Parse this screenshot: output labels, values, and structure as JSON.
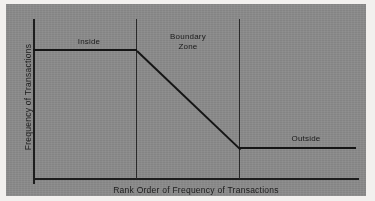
{
  "chart_data": {
    "type": "line",
    "title": "",
    "xlabel": "Rank Order of Frequency of Transactions",
    "ylabel": "Frequency of Transactions",
    "grid": false,
    "legend": "none",
    "axis_ticks": {
      "x": [],
      "y": []
    },
    "annotations": [
      {
        "name": "inside",
        "text": "Inside"
      },
      {
        "name": "boundary-zone",
        "text": "Boundary\nZone"
      },
      {
        "name": "outside",
        "text": "Outside"
      }
    ],
    "zone_dividers": [
      {
        "name": "inside-boundary-divider",
        "x": 0.32
      },
      {
        "name": "boundary-outside-divider",
        "x": 0.63
      }
    ],
    "series": [
      {
        "name": "transaction-frequency",
        "points": [
          {
            "x": 0.0,
            "y": 0.79
          },
          {
            "x": 0.32,
            "y": 0.79
          },
          {
            "x": 0.63,
            "y": 0.19
          },
          {
            "x": 1.0,
            "y": 0.19
          }
        ]
      }
    ],
    "xlim": [
      0,
      1
    ],
    "ylim": [
      0,
      1
    ],
    "colors": {
      "panel_background": "#8a8a8a",
      "page_background": "#f2f0ee",
      "line": "#141414",
      "axis": "#1d1d1d",
      "text": "#1a1a1a"
    }
  },
  "labels": {
    "inside": "Inside",
    "boundary_zone": "Boundary\nZone",
    "outside": "Outside",
    "x_axis_title": "Rank Order of Frequency of Transactions",
    "y_axis_title": "Frequency of Transactions"
  }
}
